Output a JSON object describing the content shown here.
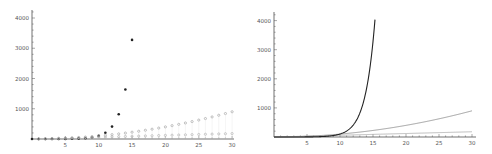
{
  "chart_data": [
    {
      "type": "scatter",
      "title": "",
      "xlabel": "",
      "ylabel": "",
      "xlim": [
        0,
        30
      ],
      "ylim": [
        0,
        4200
      ],
      "grid": false,
      "legend": null,
      "xticks": [
        5,
        10,
        15,
        20,
        25,
        30
      ],
      "yticks": [
        1000,
        2000,
        3000,
        4000
      ],
      "series": [
        {
          "name": "exponential",
          "color": "#222222",
          "x": [
            0,
            1,
            2,
            3,
            4,
            5,
            6,
            7,
            8,
            9,
            10,
            11,
            12,
            13,
            14,
            15
          ],
          "values": [
            0.1,
            0.2,
            0.4,
            0.8,
            1.6,
            3.2,
            6.4,
            12.8,
            25.6,
            51.2,
            102.4,
            204.8,
            409.6,
            819.2,
            1638.4,
            3276.8
          ]
        },
        {
          "name": "quadratic",
          "color": "#999999",
          "x": [
            0,
            1,
            2,
            3,
            4,
            5,
            6,
            7,
            8,
            9,
            10,
            11,
            12,
            13,
            14,
            15,
            16,
            17,
            18,
            19,
            20,
            21,
            22,
            23,
            24,
            25,
            26,
            27,
            28,
            29,
            30
          ],
          "values": [
            0,
            1,
            4,
            9,
            16,
            25,
            36,
            49,
            64,
            81,
            100,
            121,
            144,
            169,
            196,
            225,
            256,
            289,
            324,
            361,
            400,
            441,
            484,
            529,
            576,
            625,
            676,
            729,
            784,
            841,
            900
          ]
        },
        {
          "name": "linear",
          "color": "#aaaaaa",
          "x": [
            0,
            1,
            2,
            3,
            4,
            5,
            6,
            7,
            8,
            9,
            10,
            11,
            12,
            13,
            14,
            15,
            16,
            17,
            18,
            19,
            20,
            21,
            22,
            23,
            24,
            25,
            26,
            27,
            28,
            29,
            30
          ],
          "values": [
            0,
            6,
            12,
            18,
            24,
            30,
            36,
            42,
            48,
            54,
            60,
            66,
            72,
            78,
            84,
            90,
            96,
            102,
            108,
            114,
            120,
            126,
            132,
            138,
            144,
            150,
            156,
            162,
            168,
            174,
            180
          ]
        }
      ]
    },
    {
      "type": "line",
      "title": "",
      "xlabel": "",
      "ylabel": "",
      "xlim": [
        0,
        30
      ],
      "ylim": [
        0,
        4200
      ],
      "grid": false,
      "legend": null,
      "xticks": [
        5,
        10,
        15,
        20,
        25,
        30
      ],
      "yticks": [
        1000,
        2000,
        3000,
        4000
      ],
      "series": [
        {
          "name": "exponential",
          "color": "#222222",
          "fn": "0.1*2^x",
          "xmax": 15.3
        },
        {
          "name": "quadratic",
          "color": "#888888",
          "fn": "x^2",
          "xmax": 30
        },
        {
          "name": "linear",
          "color": "#aaaaaa",
          "fn": "6*x",
          "xmax": 30
        }
      ]
    }
  ]
}
